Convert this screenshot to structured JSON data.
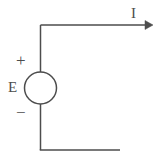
{
  "figure": {
    "name": "dc-voltage-source-circuit",
    "background_color": "#ffffff",
    "line_color": "#4d4d4d",
    "line_width": 1.5,
    "width": 160,
    "height": 160
  },
  "labels": {
    "current": "I",
    "source": "E",
    "positive_terminal": "+",
    "negative_terminal": "−"
  },
  "components": {
    "source": {
      "type": "circle",
      "name": "voltage-source-symbol",
      "cx": 40.5,
      "cy": 88,
      "r": 16
    },
    "wires": [
      {
        "name": "top-wire",
        "x1": 40.5,
        "y1": 25,
        "x2": 146,
        "y2": 25
      },
      {
        "name": "upper-left-wire",
        "x1": 40.5,
        "y1": 25,
        "x2": 40.5,
        "y2": 72
      },
      {
        "name": "lower-left-wire",
        "x1": 40.5,
        "y1": 104,
        "x2": 40.5,
        "y2": 150
      },
      {
        "name": "bottom-wire",
        "x1": 40.5,
        "y1": 150,
        "x2": 120,
        "y2": 150
      }
    ],
    "arrow": {
      "name": "current-direction-arrowhead",
      "tip_x": 153,
      "tip_y": 25,
      "points": "145,20.5 153,25 145,29.5"
    }
  }
}
